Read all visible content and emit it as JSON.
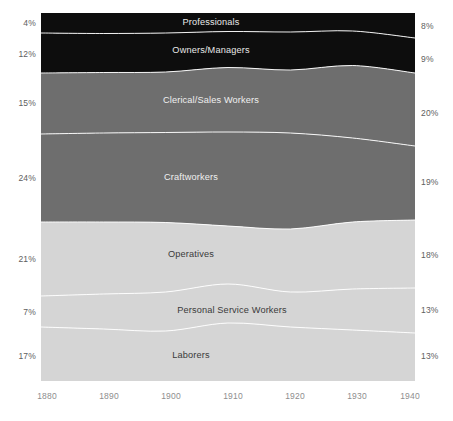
{
  "chart_data": {
    "type": "area",
    "title": "",
    "subtitle": "",
    "xlabel": "",
    "ylabel": "",
    "stacked": true,
    "normalized": true,
    "grid": false,
    "legend_position": "inline-band-labels",
    "x": [
      1880,
      1890,
      1900,
      1910,
      1920,
      1930,
      1940
    ],
    "xlim": [
      1880,
      1940
    ],
    "ylim": [
      0,
      100
    ],
    "xtick_labels": [
      "1880",
      "1890",
      "1900",
      "1910",
      "1920",
      "1930",
      "1940"
    ],
    "left_endpoint_labels": [
      "4%",
      "12%",
      "15%",
      "24%",
      "21%",
      "7%",
      "17%"
    ],
    "right_endpoint_labels": [
      "8%",
      "9%",
      "20%",
      "19%",
      "18%",
      "13%",
      "13%"
    ],
    "series": [
      {
        "name": "Professionals",
        "color": "#0d0d0d",
        "start_value": 4,
        "end_value": 8,
        "values": [
          4,
          4.5,
          5,
          5.5,
          5.5,
          6,
          8
        ]
      },
      {
        "name": "Owners/Managers",
        "color": "#0d0d0d",
        "start_value": 12,
        "end_value": 9,
        "values": [
          12,
          11.5,
          11,
          10.5,
          11,
          11,
          9
        ]
      },
      {
        "name": "Clerical/Sales Workers",
        "color": "#6e6e6e",
        "start_value": 15,
        "end_value": 20,
        "values": [
          15,
          16,
          16.5,
          17,
          17,
          18.5,
          20
        ]
      },
      {
        "name": "Craftworkers",
        "color": "#6e6e6e",
        "start_value": 24,
        "end_value": 19,
        "values": [
          24,
          23.5,
          23,
          22,
          21,
          20.5,
          19
        ]
      },
      {
        "name": "Operatives",
        "color": "#d5d5d5",
        "start_value": 21,
        "end_value": 18,
        "values": [
          21,
          20.5,
          20,
          17.5,
          18,
          18.5,
          18
        ]
      },
      {
        "name": "Personal Service Workers",
        "color": "#d5d5d5",
        "start_value": 7,
        "end_value": 13,
        "values": [
          7,
          8,
          9,
          10.5,
          11,
          12,
          13
        ]
      },
      {
        "name": "Laborers",
        "color": "#d5d5d5",
        "start_value": 17,
        "end_value": 13,
        "values": [
          17,
          16,
          15.5,
          17,
          16.5,
          13.5,
          13
        ]
      }
    ],
    "boundaries_px": {
      "plot": {
        "x0": 41,
        "y0": 13,
        "x1": 415,
        "y1": 381
      },
      "b1_professionals_owners": [
        33,
        33.5,
        33,
        31.5,
        32,
        31,
        38
      ],
      "b2_owners_clerical": [
        73,
        72.5,
        72,
        67.5,
        70,
        65.5,
        73
      ],
      "b3_clerical_craft": [
        134,
        133,
        132.5,
        132,
        133,
        138,
        146
      ],
      "b4_craft_operatives": [
        222,
        222,
        222.5,
        226,
        229,
        222,
        220
      ],
      "b5_operatives_personal": [
        296,
        294,
        292,
        284,
        292,
        289,
        288
      ],
      "b6_personal_laborers": [
        327,
        329,
        331,
        323,
        327,
        330,
        333
      ]
    },
    "band_label_positions": [
      {
        "name": "Professionals",
        "x": 211,
        "y": 22,
        "tone": "on-dark"
      },
      {
        "name": "Owners/Managers",
        "x": 211,
        "y": 50,
        "tone": "on-dark"
      },
      {
        "name": "Clerical/Sales Workers",
        "x": 211,
        "y": 100,
        "tone": "on-mid"
      },
      {
        "name": "Craftworkers",
        "x": 191,
        "y": 177,
        "tone": "on-mid"
      },
      {
        "name": "Operatives",
        "x": 191,
        "y": 254,
        "tone": "on-light"
      },
      {
        "name": "Personal Service Workers",
        "x": 232,
        "y": 310,
        "tone": "on-light"
      },
      {
        "name": "Laborers",
        "x": 191,
        "y": 355,
        "tone": "on-light"
      }
    ],
    "left_label_positions_px": [
      22,
      53,
      102,
      177,
      258,
      311,
      355
    ],
    "right_label_positions_px": [
      25,
      58,
      112,
      181,
      254,
      309,
      355
    ],
    "xtick_positions_px": [
      47,
      109,
      171,
      233,
      295,
      357,
      412
    ]
  },
  "colors": {
    "background": "#ffffff",
    "dark_band": "#0d0d0d",
    "mid_band": "#6e6e6e",
    "light_band": "#d5d5d5",
    "separator_line": "#ffffff",
    "axis_text": "#5e5e5e",
    "xtick_text": "#8e8e8e"
  }
}
